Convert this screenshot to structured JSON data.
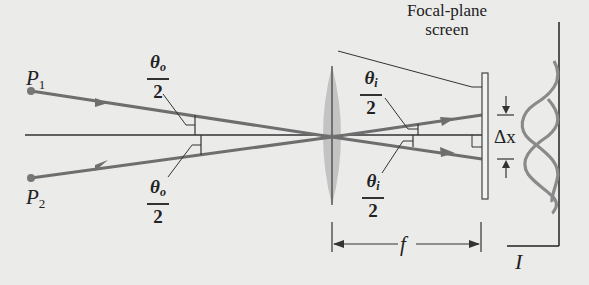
{
  "figure": {
    "title_line1": "Focal-plane",
    "title_line2": "screen",
    "points": [
      {
        "label": "P",
        "sub": "1"
      },
      {
        "label": "P",
        "sub": "2"
      }
    ],
    "angles": {
      "object_top": {
        "symbol": "θ",
        "sub": "o",
        "den": "2"
      },
      "object_bottom": {
        "symbol": "θ",
        "sub": "o",
        "den": "2"
      },
      "image_top": {
        "symbol": "θ",
        "sub": "i",
        "den": "2"
      },
      "image_bottom": {
        "symbol": "θ",
        "sub": "i",
        "den": "2"
      }
    },
    "focal_length_label": "f",
    "separation_label": "Δx",
    "intensity_label": "I",
    "colors": {
      "background": "#ebebea",
      "ray": "#6e6e6e",
      "line": "#333333",
      "lens": "#b9b9b9",
      "curve": "#8a8a8a"
    }
  }
}
